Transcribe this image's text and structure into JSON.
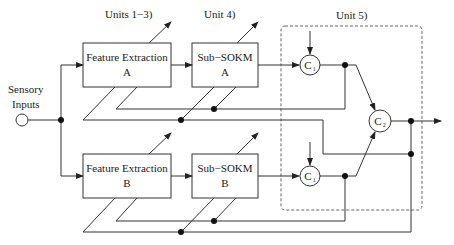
{
  "diagram": {
    "section_labels": {
      "units_1_3": "Units 1−3)",
      "unit_4": "Unit 4)",
      "unit_5": "Unit 5)"
    },
    "input": {
      "line1": "Sensory",
      "line2": "Inputs"
    },
    "blocks": {
      "feature_a": {
        "title": "Feature Extraction",
        "sub": "A"
      },
      "sokm_a": {
        "title": "Sub−SOKM",
        "sub": "A"
      },
      "feature_b": {
        "title": "Feature Extraction",
        "sub": "B"
      },
      "sokm_b": {
        "title": "Sub−SOKM",
        "sub": "B"
      }
    },
    "nodes": {
      "c1_top": {
        "letter": "C",
        "sub": "1"
      },
      "c1_bottom": {
        "letter": "C",
        "sub": "1"
      },
      "c2": {
        "letter": "C",
        "sub": "2"
      }
    },
    "colors": {
      "line": "#333333",
      "dashed": "#666666",
      "background": "#ffffff"
    }
  }
}
